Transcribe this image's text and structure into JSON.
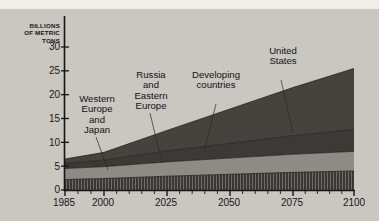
{
  "chart_data": {
    "type": "area",
    "stacked": true,
    "title": "",
    "subtitle": "",
    "xlabel": "",
    "ylabel": "BILLIONS OF METRIC TONS",
    "ylabel_lines": "BILLIONS\nOF METRIC\nTONS",
    "x": [
      1985,
      2000,
      2025,
      2050,
      2075,
      2100
    ],
    "xtick_labels": [
      "1985",
      "2000",
      "2025",
      "2050",
      "2075",
      "2100"
    ],
    "xlim": [
      1985,
      2100
    ],
    "ylim": [
      0,
      30
    ],
    "ytick_labels": [
      "0",
      "5",
      "10",
      "15",
      "20",
      "25",
      "30"
    ],
    "ytick_values": [
      0,
      5,
      10,
      15,
      20,
      25,
      30
    ],
    "grid": false,
    "legend": "inline-labels-with-leader-lines",
    "series": [
      {
        "name": "United States",
        "order": 1,
        "fill": "#3a3834",
        "pattern": "vertical-hatch",
        "values": [
          2.2,
          2.4,
          2.9,
          3.3,
          3.7,
          4.0
        ]
      },
      {
        "name": "Western Europe and Japan",
        "label_lines": "Western\nEurope\nand\nJapan",
        "order": 2,
        "fill": "#8d8b84",
        "pattern": "solid",
        "values": [
          2.3,
          2.5,
          3.0,
          3.4,
          3.8,
          4.1
        ]
      },
      {
        "name": "Russia and Eastern Europe",
        "label_lines": "Russia\nand\nEastern\nEurope",
        "order": 3,
        "fill": "#3c3a36",
        "pattern": "solid",
        "values": [
          1.1,
          1.4,
          2.3,
          3.1,
          3.9,
          4.6
        ]
      },
      {
        "name": "Developing countries",
        "label_lines": "Developing\ncountries",
        "order": 4,
        "fill": "#46433e",
        "pattern": "solid",
        "values": [
          0.9,
          1.6,
          4.3,
          7.2,
          10.1,
          12.8
        ]
      }
    ],
    "totals": [
      6.5,
      7.9,
      12.5,
      17.0,
      21.5,
      25.5
    ],
    "colors": {
      "background": "#c9c7c0",
      "axis": "#17161a",
      "text": "#17161a",
      "band_developing": "#46433e",
      "band_russia": "#3c3a36",
      "band_westeurope_japan": "#8d8b84",
      "band_unitedstates": "#3a3834"
    }
  },
  "axis": {
    "y_unit_caption": "BILLIONS\nOF METRIC\nTONS",
    "y_ticks": [
      {
        "label": "30",
        "value": 30
      },
      {
        "label": "25",
        "value": 25
      },
      {
        "label": "20",
        "value": 20
      },
      {
        "label": "15",
        "value": 15
      },
      {
        "label": "10",
        "value": 10
      },
      {
        "label": "5",
        "value": 5
      },
      {
        "label": "0",
        "value": 0
      }
    ],
    "x_ticks": [
      {
        "label": "1985",
        "value": 1985
      },
      {
        "label": "2000",
        "value": 2000
      },
      {
        "label": "2025",
        "value": 2025
      },
      {
        "label": "2050",
        "value": 2050
      },
      {
        "label": "2075",
        "value": 2075
      },
      {
        "label": "2100",
        "value": 2100
      }
    ]
  },
  "labels": {
    "western_europe_japan": "Western\nEurope\nand\nJapan",
    "russia_eastern_europe": "Russia\nand\nEastern\nEurope",
    "developing_countries": "Developing\ncountries",
    "united_states": "United\nStates"
  }
}
